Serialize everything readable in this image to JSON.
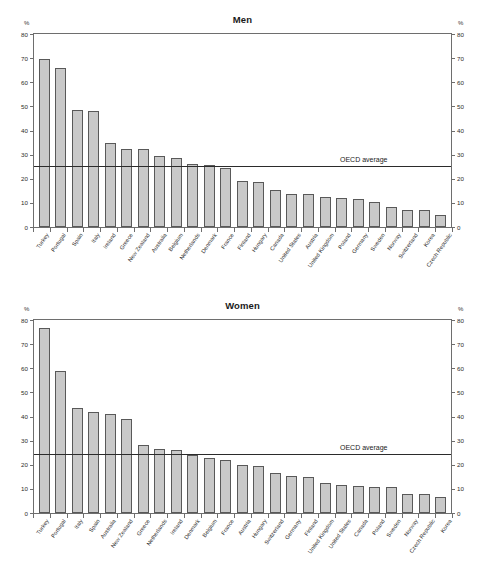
{
  "axis": {
    "unit_label": "%",
    "ticks": [
      0,
      10,
      20,
      30,
      40,
      50,
      60,
      70,
      80
    ],
    "oecd_label": "OECD average"
  },
  "chart_data": [
    {
      "type": "bar",
      "title": "Men",
      "xlabel": "",
      "ylabel": "%",
      "ylim": [
        0,
        80
      ],
      "grid": false,
      "legend": "none",
      "annotations": [
        {
          "text": "OECD average",
          "value": 25.5,
          "kind": "hline"
        }
      ],
      "categories": [
        "Turkey",
        "Portugal",
        "Spain",
        "Italy",
        "Ireland",
        "Greece",
        "New Zealand",
        "Australia",
        "Belgium",
        "Netherlands",
        "Denmark",
        "France",
        "Finland",
        "Hungary",
        "Canada",
        "United States",
        "Austria",
        "United Kingdom",
        "Poland",
        "Germany",
        "Sweden",
        "Norway",
        "Switzerland",
        "Korea",
        "Czech Republic"
      ],
      "values": [
        69.5,
        66.0,
        48.5,
        48.0,
        35.0,
        32.5,
        32.5,
        29.5,
        28.5,
        26.0,
        25.5,
        24.5,
        19.0,
        18.5,
        15.5,
        13.5,
        13.5,
        12.5,
        12.0,
        11.5,
        10.5,
        8.5,
        7.0,
        7.0,
        5.0
      ]
    },
    {
      "type": "bar",
      "title": "Women",
      "xlabel": "",
      "ylabel": "%",
      "ylim": [
        0,
        80
      ],
      "grid": false,
      "legend": "none",
      "annotations": [
        {
          "text": "OECD average",
          "value": 25.0,
          "kind": "hline"
        }
      ],
      "categories": [
        "Turkey",
        "Portugal",
        "Italy",
        "Spain",
        "Australia",
        "New Zealand",
        "Greece",
        "Netherlands",
        "Ireland",
        "Denmark",
        "Belgium",
        "France",
        "Austria",
        "Hungary",
        "Switzerland",
        "Germany",
        "Finland",
        "United Kingdom",
        "United States",
        "Canada",
        "Poland",
        "Sweden",
        "Norway",
        "Czech Republic",
        "Korea"
      ],
      "values": [
        76.5,
        59.0,
        43.5,
        42.0,
        41.0,
        39.0,
        28.0,
        26.5,
        26.0,
        24.0,
        23.0,
        22.0,
        20.0,
        19.5,
        16.5,
        15.5,
        15.0,
        12.5,
        11.5,
        11.0,
        10.8,
        10.8,
        8.0,
        8.0,
        6.5
      ]
    }
  ]
}
